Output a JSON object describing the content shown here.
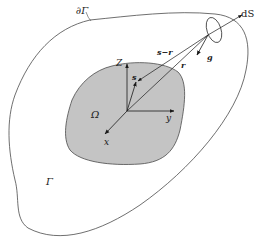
{
  "diagram": {
    "labels": {
      "outer_boundary": "∂Γ",
      "outer_region": "Γ",
      "inner_region": "Ω",
      "surface_element": "dS",
      "axis_z": "Z",
      "axis_y": "y",
      "axis_x": "x",
      "source_point": "s",
      "vector_s_minus_r": "s−r",
      "vector_r": "r",
      "vector_g": "g"
    },
    "colors": {
      "inner_fill": "#c4c4c4",
      "stroke": "#3a3a3a",
      "background": "#ffffff"
    }
  }
}
